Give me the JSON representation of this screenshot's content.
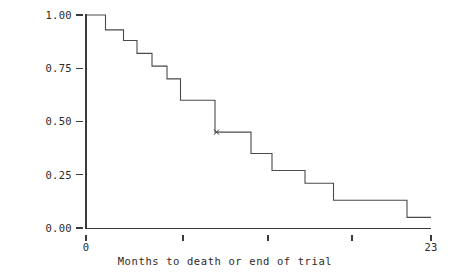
{
  "chart_data": {
    "type": "line",
    "subtype": "kaplan-meier-step",
    "title": "",
    "xlabel": "Months to death or end of trial",
    "ylabel": "Survival Probability",
    "xlim": [
      0,
      23
    ],
    "ylim": [
      0.0,
      1.0
    ],
    "grid": false,
    "legend": "none",
    "x_tick_labels": [
      "0",
      "",
      "",
      "",
      "23"
    ],
    "x_tick_values": [
      0,
      6.5,
      12.2,
      17.8,
      23
    ],
    "y_tick_labels": [
      "0.00",
      "0.25",
      "0.50",
      "0.75",
      "1.00"
    ],
    "y_tick_values": [
      0.0,
      0.25,
      0.5,
      0.75,
      1.0
    ],
    "step_points": [
      {
        "x": 0.0,
        "y": 1.0
      },
      {
        "x": 1.3,
        "y": 1.0
      },
      {
        "x": 1.3,
        "y": 0.93
      },
      {
        "x": 2.5,
        "y": 0.93
      },
      {
        "x": 2.5,
        "y": 0.88
      },
      {
        "x": 3.4,
        "y": 0.88
      },
      {
        "x": 3.4,
        "y": 0.82
      },
      {
        "x": 4.4,
        "y": 0.82
      },
      {
        "x": 4.4,
        "y": 0.76
      },
      {
        "x": 5.4,
        "y": 0.76
      },
      {
        "x": 5.4,
        "y": 0.7
      },
      {
        "x": 6.3,
        "y": 0.7
      },
      {
        "x": 6.3,
        "y": 0.6
      },
      {
        "x": 8.6,
        "y": 0.6
      },
      {
        "x": 8.6,
        "y": 0.45
      },
      {
        "x": 11.0,
        "y": 0.45
      },
      {
        "x": 11.0,
        "y": 0.35
      },
      {
        "x": 12.4,
        "y": 0.35
      },
      {
        "x": 12.4,
        "y": 0.27
      },
      {
        "x": 14.6,
        "y": 0.27
      },
      {
        "x": 14.6,
        "y": 0.21
      },
      {
        "x": 16.5,
        "y": 0.21
      },
      {
        "x": 16.5,
        "y": 0.13
      },
      {
        "x": 21.4,
        "y": 0.13
      },
      {
        "x": 21.4,
        "y": 0.05
      },
      {
        "x": 23.0,
        "y": 0.05
      }
    ],
    "censor_marks": [
      {
        "x": 8.7,
        "y": 0.45
      }
    ],
    "series_name": "Survival Probability"
  },
  "axes": {
    "x_title": "Months to death or end of trial",
    "y_title": "Survival Probability",
    "y_labels": [
      "1.00",
      "0.75",
      "0.50",
      "0.25",
      "0.00"
    ],
    "x_labels": [
      "0",
      "23"
    ]
  },
  "colors": {
    "curve": "#4a4a4a",
    "axis": "#3a3a3a",
    "text": "#2b2b2b",
    "background": "#ffffff"
  }
}
